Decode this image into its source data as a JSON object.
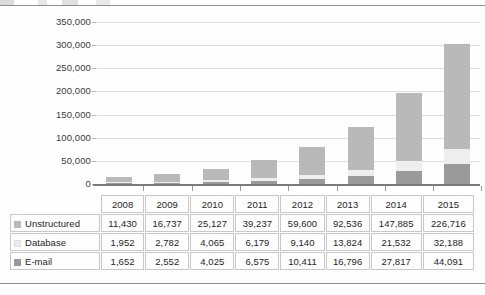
{
  "chart_data": {
    "type": "bar",
    "subtype": "stacked-column",
    "title": "",
    "xlabel": "",
    "ylabel": "",
    "categories": [
      "2008",
      "2009",
      "2010",
      "2011",
      "2012",
      "2013",
      "2014",
      "2015"
    ],
    "series": [
      {
        "name": "Unstructured",
        "color": "#b9b9b9",
        "values": [
          11430,
          16737,
          25127,
          39237,
          59600,
          92536,
          147885,
          226716
        ],
        "labels": [
          "11,430",
          "16,737",
          "25,127",
          "39,237",
          "59,600",
          "92,536",
          "147,885",
          "226,716"
        ]
      },
      {
        "name": "Database",
        "color": "#eeeeee",
        "values": [
          1952,
          2782,
          4065,
          6179,
          9140,
          13824,
          21532,
          32188
        ],
        "labels": [
          "1,952",
          "2,782",
          "4,065",
          "6,179",
          "9,140",
          "13,824",
          "21,532",
          "32,188"
        ]
      },
      {
        "name": "E-mail",
        "color": "#9a9a9a",
        "values": [
          1652,
          2552,
          4025,
          6575,
          10411,
          16796,
          27817,
          44091
        ],
        "labels": [
          "1,652",
          "2,552",
          "4,025",
          "6,575",
          "10,411",
          "16,796",
          "27,817",
          "44,091"
        ]
      }
    ],
    "stack_order_bottom_to_top": [
      "E-mail",
      "Database",
      "Unstructured"
    ],
    "ylim": [
      0,
      350000
    ],
    "ytick_values": [
      0,
      50000,
      100000,
      150000,
      200000,
      250000,
      300000,
      350000
    ],
    "ytick_labels": [
      "0",
      "50,000",
      "100,000",
      "150,000",
      "200,000",
      "250,000",
      "300,000",
      "350,000"
    ],
    "grid": true,
    "grid_axis": "y",
    "legend": "table-row-labels"
  },
  "table": {
    "header_row": [
      "",
      "2008",
      "2009",
      "2010",
      "2011",
      "2012",
      "2013",
      "2014",
      "2015"
    ],
    "rows": [
      {
        "label": "Unstructured",
        "swatch": "unstructured-swatch",
        "cells": [
          "11,430",
          "16,737",
          "25,127",
          "39,237",
          "59,600",
          "92,536",
          "147,885",
          "226,716"
        ]
      },
      {
        "label": "Database",
        "swatch": "database-swatch",
        "cells": [
          "1,952",
          "2,782",
          "4,065",
          "6,179",
          "9,140",
          "13,824",
          "21,532",
          "32,188"
        ]
      },
      {
        "label": "E-mail",
        "swatch": "email-swatch",
        "cells": [
          "1,652",
          "2,552",
          "4,025",
          "6,575",
          "10,411",
          "16,796",
          "27,817",
          "44,091"
        ]
      }
    ]
  },
  "colors": {
    "unstructured": "#b9b9b9",
    "database": "#eeeeee",
    "email": "#9a9a9a",
    "gridline": "#dedede",
    "axis": "#7a7a7a",
    "cell_border": "#c8c8c8"
  }
}
